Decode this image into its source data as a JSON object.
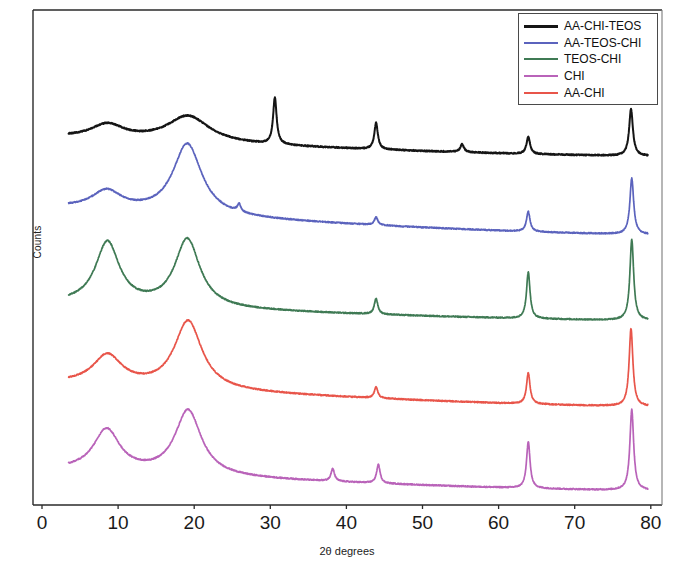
{
  "chart_data": {
    "type": "line",
    "title": "",
    "xlabel": "2θ degrees",
    "ylabel": "Counts",
    "xlim": [
      0,
      80
    ],
    "xticks": [
      0,
      10,
      20,
      30,
      40,
      50,
      60,
      70,
      80
    ],
    "xtick_labels": [
      "0",
      "10",
      "20",
      "30",
      "40",
      "50",
      "60",
      "70",
      "80"
    ],
    "yticks": [],
    "ytick_labels": [],
    "grid": false,
    "legend_position": "upper right",
    "note": "Stacked/offset XRD diffractograms; y-axis in arbitrary counts with vertical offsets per curve",
    "series": [
      {
        "name": "AA-CHI-TEOS",
        "color": "#151515",
        "offset_index": 0,
        "broad_peaks": [
          {
            "x": 8.6,
            "height": 9,
            "width": 2.6
          },
          {
            "x": 19.2,
            "height": 17,
            "width": 3.4
          }
        ],
        "sharp_peaks": [
          {
            "x": 30.6,
            "height": 30,
            "width": 0.28
          },
          {
            "x": 43.9,
            "height": 17,
            "width": 0.28
          },
          {
            "x": 55.2,
            "height": 5,
            "width": 0.3
          },
          {
            "x": 63.9,
            "height": 11,
            "width": 0.28
          },
          {
            "x": 77.4,
            "height": 30,
            "width": 0.3
          }
        ],
        "baseline_start": 12,
        "baseline_end": 0
      },
      {
        "name": "AA-TEOS-CHI",
        "color": "#5b63bd",
        "offset_index": 1,
        "broad_peaks": [
          {
            "x": 8.5,
            "height": 12,
            "width": 2.4
          },
          {
            "x": 19.1,
            "height": 46,
            "width": 2.3
          }
        ],
        "sharp_peaks": [
          {
            "x": 25.9,
            "height": 5,
            "width": 0.28
          },
          {
            "x": 43.9,
            "height": 5,
            "width": 0.28
          },
          {
            "x": 63.9,
            "height": 13,
            "width": 0.28
          },
          {
            "x": 77.5,
            "height": 36,
            "width": 0.3
          }
        ],
        "baseline_start": 18,
        "baseline_end": 1
      },
      {
        "name": "TEOS-CHI",
        "color": "#3f7a54",
        "offset_index": 2,
        "broad_peaks": [
          {
            "x": 8.6,
            "height": 40,
            "width": 1.9
          },
          {
            "x": 19.1,
            "height": 44,
            "width": 2.0
          }
        ],
        "sharp_peaks": [
          {
            "x": 43.9,
            "height": 10,
            "width": 0.28
          },
          {
            "x": 63.9,
            "height": 30,
            "width": 0.28
          },
          {
            "x": 77.5,
            "height": 52,
            "width": 0.3
          }
        ],
        "baseline_start": 12,
        "baseline_end": 1
      },
      {
        "name": "CHI",
        "color": "#b963b9",
        "offset_index": 4,
        "broad_peaks": [
          {
            "x": 8.5,
            "height": 27,
            "width": 2.1
          },
          {
            "x": 19.2,
            "height": 42,
            "width": 2.1
          }
        ],
        "sharp_peaks": [
          {
            "x": 38.2,
            "height": 8,
            "width": 0.28
          },
          {
            "x": 44.2,
            "height": 12,
            "width": 0.28
          },
          {
            "x": 63.9,
            "height": 30,
            "width": 0.28
          },
          {
            "x": 77.5,
            "height": 52,
            "width": 0.3
          }
        ],
        "baseline_start": 14,
        "baseline_end": 1
      },
      {
        "name": "AA-CHI",
        "color": "#e8554a",
        "offset_index": 3,
        "broad_peaks": [
          {
            "x": 8.6,
            "height": 19,
            "width": 2.3
          },
          {
            "x": 19.2,
            "height": 44,
            "width": 2.2
          }
        ],
        "sharp_peaks": [
          {
            "x": 43.9,
            "height": 7,
            "width": 0.28
          },
          {
            "x": 63.9,
            "height": 20,
            "width": 0.28
          },
          {
            "x": 77.4,
            "height": 50,
            "width": 0.3
          }
        ],
        "baseline_start": 16,
        "baseline_end": 1
      }
    ]
  },
  "legend": {
    "items": [
      {
        "label": "AA-CHI-TEOS",
        "color": "#151515"
      },
      {
        "label": "AA-TEOS-CHI",
        "color": "#5b63bd"
      },
      {
        "label": "TEOS-CHI",
        "color": "#3f7a54"
      },
      {
        "label": "CHI",
        "color": "#b963b9"
      },
      {
        "label": "AA-CHI",
        "color": "#e8554a"
      }
    ]
  },
  "axes": {
    "xlabel": "2θ degrees",
    "ylabel": "Counts",
    "xtick_labels": [
      "0",
      "10",
      "20",
      "30",
      "40",
      "50",
      "60",
      "70",
      "80"
    ]
  }
}
